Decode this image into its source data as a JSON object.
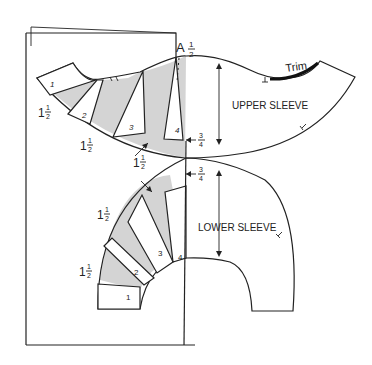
{
  "diagram": {
    "type": "sewing-pattern",
    "pieces": {
      "upper_sleeve": {
        "label": "UPPER SLEEVE"
      },
      "lower_sleeve": {
        "label": "LOWER SLEEVE"
      }
    },
    "labels": {
      "point_a": "A",
      "trim": "Trim",
      "half_inch": "1/2\"",
      "three_quarter_top": "3/4\"",
      "three_quarter_bottom": "3/4\"",
      "upper_left_1": "1 1/2\"",
      "upper_left_2": "1 1/2\"",
      "center_gap": "1 1/2\"",
      "lower_left_1": "1 1/2\"",
      "lower_left_2": "1 1/2\""
    },
    "fractions": {
      "one_half": {
        "whole": "1",
        "num": "1",
        "den": "2",
        "unit": "\""
      },
      "half": {
        "num": "1",
        "den": "2",
        "unit": "\""
      },
      "three_quarter": {
        "num": "3",
        "den": "4",
        "unit": "\""
      }
    },
    "upper_sections": [
      "1",
      "2",
      "3",
      "4"
    ],
    "lower_sections": [
      "1",
      "2",
      "3",
      "4"
    ],
    "colors": {
      "line": "#222222",
      "shade": "#d4d4d4",
      "background": "#ffffff"
    }
  }
}
